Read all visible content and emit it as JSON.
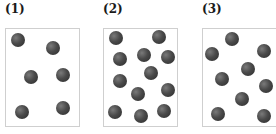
{
  "panels": [
    {
      "label": "(1)",
      "label_x": 5,
      "box": {
        "x": 5,
        "y": 28,
        "w": 75,
        "h": 99
      },
      "particles": [
        [
          18,
          40
        ],
        [
          53,
          48
        ],
        [
          31,
          77
        ],
        [
          63,
          75
        ],
        [
          22,
          112
        ],
        [
          63,
          108
        ]
      ]
    },
    {
      "label": "(2)",
      "label_x": 103,
      "box": {
        "x": 103,
        "y": 28,
        "w": 75,
        "h": 99
      },
      "particles": [
        [
          116,
          38
        ],
        [
          159,
          37
        ],
        [
          120,
          59
        ],
        [
          144,
          55
        ],
        [
          168,
          57
        ],
        [
          151,
          73
        ],
        [
          120,
          81
        ],
        [
          168,
          90
        ],
        [
          138,
          94
        ],
        [
          115,
          112
        ],
        [
          141,
          116
        ],
        [
          164,
          111
        ]
      ]
    },
    {
      "label": "(3)",
      "label_x": 202,
      "box": {
        "x": 202,
        "y": 28,
        "w": 80,
        "h": 99
      },
      "particles": [
        [
          232,
          39
        ],
        [
          212,
          54
        ],
        [
          264,
          51
        ],
        [
          248,
          69
        ],
        [
          222,
          79
        ],
        [
          266,
          86
        ],
        [
          242,
          99
        ],
        [
          218,
          114
        ],
        [
          264,
          116
        ]
      ]
    }
  ],
  "particle_color": "#4a4a4a",
  "box_border_color": "#cfcfcf"
}
